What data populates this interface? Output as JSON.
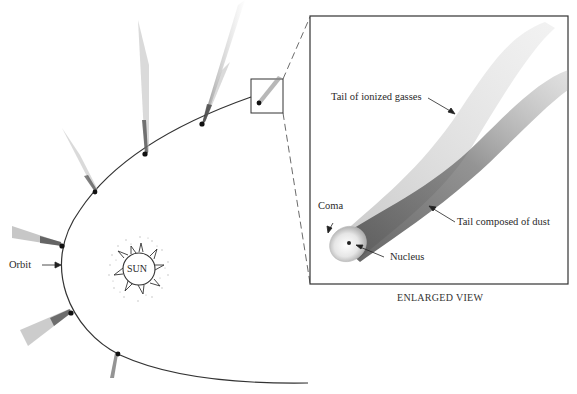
{
  "diagram": {
    "labels": {
      "sun": "SUN",
      "orbit": "Orbit",
      "tail_gas": "Tail of ionized gasses",
      "tail_dust": "Tail composed of dust",
      "coma": "Coma",
      "nucleus": "Nucleus",
      "caption": "ENLARGED VIEW"
    },
    "comet_positions": [
      {
        "x": 285,
        "y": 100,
        "note": "boxed / enlarged"
      },
      {
        "x": 202,
        "y": 124
      },
      {
        "x": 145,
        "y": 154
      },
      {
        "x": 95,
        "y": 192
      },
      {
        "x": 62,
        "y": 246
      },
      {
        "x": 71,
        "y": 313
      },
      {
        "x": 118,
        "y": 354
      }
    ],
    "colors": {
      "line": "#333333",
      "tail": "#8a8a8a",
      "background": "#ffffff"
    }
  }
}
